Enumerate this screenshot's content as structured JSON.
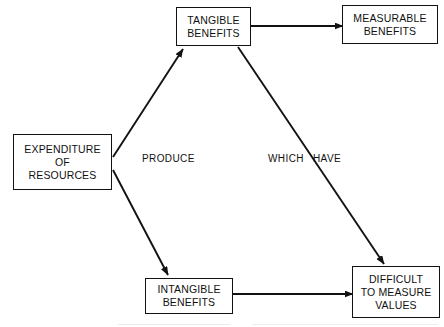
{
  "diagram": {
    "background_color": "#ffffff",
    "stroke_color": "#121212",
    "text_color": "#111111",
    "nodes": [
      {
        "id": "tangible",
        "lines": [
          "TANGIBLE",
          "BENEFITS"
        ]
      },
      {
        "id": "measurable",
        "lines": [
          "MEASURABLE",
          "BENEFITS"
        ]
      },
      {
        "id": "expenditure",
        "lines": [
          "EXPENDITURE",
          "OF",
          "RESOURCES"
        ]
      },
      {
        "id": "intangible",
        "lines": [
          "INTANGIBLE",
          "BENEFITS"
        ]
      },
      {
        "id": "difficult",
        "lines": [
          "DIFFICULT",
          "TO MEASURE",
          "VALUES"
        ]
      }
    ],
    "edge_labels": {
      "produce": "PRODUCE",
      "which": "WHICH",
      "have": "HAVE"
    },
    "edges": [
      {
        "id": "expenditure-to-tangible",
        "from": "expenditure",
        "to": "tangible",
        "label": "PRODUCE",
        "arrow": "end"
      },
      {
        "id": "expenditure-to-intangible",
        "from": "expenditure",
        "to": "intangible",
        "label": "PRODUCE",
        "arrow": "end"
      },
      {
        "id": "tangible-to-measurable",
        "from": "tangible",
        "to": "measurable",
        "label": "",
        "arrow": "end"
      },
      {
        "id": "tangible-to-difficult",
        "from": "tangible",
        "to": "difficult",
        "label": "WHICH HAVE",
        "arrow": "end"
      },
      {
        "id": "intangible-to-difficult",
        "from": "intangible",
        "to": "difficult",
        "label": "",
        "arrow": "end"
      }
    ]
  }
}
